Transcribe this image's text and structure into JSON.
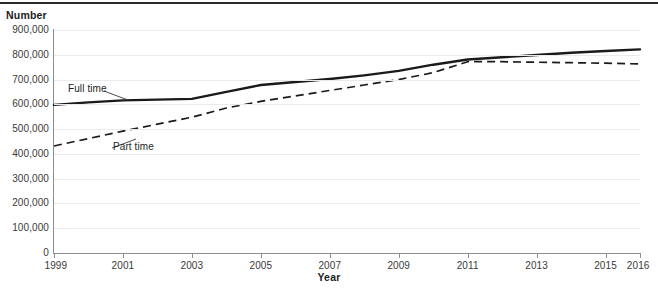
{
  "chart_data": {
    "type": "line",
    "title": "",
    "xlabel": "Year",
    "ylabel": "Number",
    "x": [
      1999,
      2000,
      2001,
      2002,
      2003,
      2004,
      2005,
      2006,
      2007,
      2008,
      2009,
      2010,
      2011,
      2012,
      2013,
      2014,
      2015,
      2016
    ],
    "xlim": [
      1999,
      2016
    ],
    "ylim": [
      0,
      900000
    ],
    "grid": true,
    "legend_position": "inline-annotations",
    "series": [
      {
        "name": "Full time",
        "style": "solid",
        "color": "#1a1a1a",
        "values": [
          598000,
          608000,
          616000,
          619000,
          622000,
          650000,
          678000,
          690000,
          702000,
          717000,
          735000,
          760000,
          781000,
          790000,
          799000,
          808000,
          815000,
          822000
        ]
      },
      {
        "name": "Part time",
        "style": "dashed",
        "color": "#1a1a1a",
        "values": [
          432000,
          462000,
          492000,
          520000,
          548000,
          585000,
          612000,
          634000,
          656000,
          678000,
          700000,
          728000,
          772000,
          772000,
          770000,
          768000,
          766000,
          763000
        ]
      }
    ],
    "y_ticks": [
      {
        "value": 900000,
        "label": "900,000"
      },
      {
        "value": 800000,
        "label": "800,000"
      },
      {
        "value": 700000,
        "label": "700,000"
      },
      {
        "value": 600000,
        "label": "600,000"
      },
      {
        "value": 500000,
        "label": "500,000"
      },
      {
        "value": 400000,
        "label": "400,000"
      },
      {
        "value": 300000,
        "label": "300,000"
      },
      {
        "value": 200000,
        "label": "200,000"
      },
      {
        "value": 100000,
        "label": "100,000"
      },
      {
        "value": 0,
        "label": "0"
      }
    ],
    "x_ticks": [
      {
        "value": 1999,
        "label": "1999"
      },
      {
        "value": 2001,
        "label": "2001"
      },
      {
        "value": 2003,
        "label": "2003"
      },
      {
        "value": 2005,
        "label": "2005"
      },
      {
        "value": 2007,
        "label": "2007"
      },
      {
        "value": 2009,
        "label": "2009"
      },
      {
        "value": 2011,
        "label": "2011"
      },
      {
        "value": 2013,
        "label": "2013"
      },
      {
        "value": 2015,
        "label": "2015"
      },
      {
        "value": 2016,
        "label": "2016"
      }
    ],
    "annotations": [
      {
        "name": "full-time-label",
        "text": "Full time"
      },
      {
        "name": "part-time-label",
        "text": "Part time"
      }
    ],
    "colors": {
      "line": "#1a1a1a",
      "axis": "#8d8d90",
      "grid": "#e9eaee",
      "rule": "#2a2a2a",
      "text": "#231f20"
    }
  },
  "axes": {
    "y_title": "Number",
    "x_title": "Year"
  }
}
